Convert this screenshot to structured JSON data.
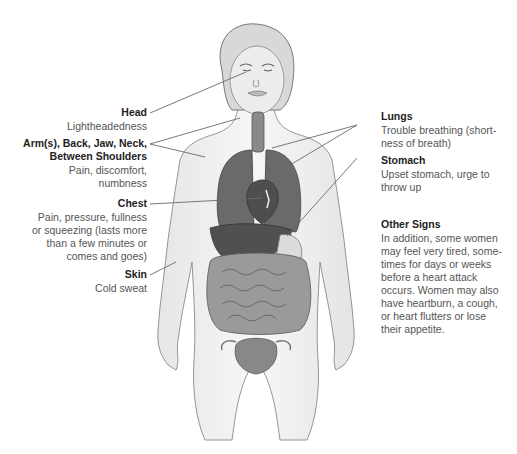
{
  "labels": {
    "head": {
      "title": "Head",
      "desc": [
        "Lightheadedness"
      ]
    },
    "arms": {
      "title": [
        "Arm(s), Back, Jaw, Neck,",
        "Between Shoulders"
      ],
      "desc": [
        "Pain, discomfort,",
        "numbness"
      ]
    },
    "chest": {
      "title": "Chest",
      "desc": [
        "Pain, pressure, fullness",
        "or squeezing (lasts more",
        "than a few minutes or",
        "comes and goes)"
      ]
    },
    "skin": {
      "title": "Skin",
      "desc": [
        "Cold sweat"
      ]
    },
    "lungs": {
      "title": "Lungs",
      "desc": [
        "Trouble breathing (short-",
        "ness of breath)"
      ]
    },
    "stomach": {
      "title": "Stomach",
      "desc": [
        "Upset stomach, urge to",
        "throw up"
      ]
    },
    "other": {
      "title": "Other Signs",
      "desc": [
        "In addition, some women",
        "may feel very tired, some-",
        "times for days or weeks",
        "before a heart attack",
        "occurs. Women may also",
        "have heartburn, a cough,",
        "or heart flutters or lose",
        "their appetite."
      ]
    }
  },
  "colors": {
    "line": "#6a6a6a",
    "organ_dark": "#4a4a4a",
    "organ_mid": "#7a7a7a",
    "body_outline": "#8a8a8a",
    "skin": "#f2f2f2"
  }
}
